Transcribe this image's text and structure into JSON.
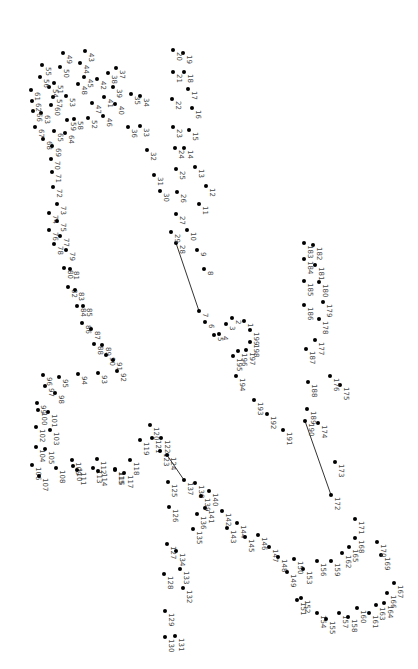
{
  "puzzle": {
    "type": "connect-the-dots",
    "dot_count": 199,
    "orientation": "rotated 90deg clockwise",
    "line_color": "#333333",
    "dot_color": "#000000",
    "label_color": "#444444",
    "drawn_segments": [
      [
        7,
        28
      ],
      [
        124,
        137
      ],
      [
        172,
        190
      ]
    ],
    "dots": [
      {
        "n": 1,
        "x": 244,
        "y": 321
      },
      {
        "n": 2,
        "x": 232,
        "y": 318
      },
      {
        "n": 3,
        "x": 226,
        "y": 324
      },
      {
        "n": 4,
        "x": 219,
        "y": 334
      },
      {
        "n": 5,
        "x": 214,
        "y": 335
      },
      {
        "n": 6,
        "x": 205,
        "y": 322
      },
      {
        "n": 7,
        "x": 199,
        "y": 311
      },
      {
        "n": 8,
        "x": 204,
        "y": 269
      },
      {
        "n": 9,
        "x": 197,
        "y": 250
      },
      {
        "n": 10,
        "x": 187,
        "y": 230
      },
      {
        "n": 11,
        "x": 199,
        "y": 204
      },
      {
        "n": 12,
        "x": 206,
        "y": 186
      },
      {
        "n": 13,
        "x": 195,
        "y": 167
      },
      {
        "n": 14,
        "x": 184,
        "y": 148
      },
      {
        "n": 15,
        "x": 189,
        "y": 130
      },
      {
        "n": 16,
        "x": 192,
        "y": 108
      },
      {
        "n": 17,
        "x": 188,
        "y": 89
      },
      {
        "n": 18,
        "x": 184,
        "y": 72
      },
      {
        "n": 19,
        "x": 183,
        "y": 53
      },
      {
        "n": 20,
        "x": 173,
        "y": 50
      },
      {
        "n": 21,
        "x": 173,
        "y": 72
      },
      {
        "n": 22,
        "x": 172,
        "y": 99
      },
      {
        "n": 23,
        "x": 173,
        "y": 127
      },
      {
        "n": 24,
        "x": 175,
        "y": 148
      },
      {
        "n": 25,
        "x": 176,
        "y": 169
      },
      {
        "n": 26,
        "x": 177,
        "y": 192
      },
      {
        "n": 27,
        "x": 176,
        "y": 214
      },
      {
        "n": 28,
        "x": 176,
        "y": 243
      },
      {
        "n": 29,
        "x": 171,
        "y": 232
      },
      {
        "n": 30,
        "x": 160,
        "y": 191
      },
      {
        "n": 31,
        "x": 154,
        "y": 175
      },
      {
        "n": 32,
        "x": 147,
        "y": 150
      },
      {
        "n": 33,
        "x": 140,
        "y": 126
      },
      {
        "n": 34,
        "x": 140,
        "y": 96
      },
      {
        "n": 35,
        "x": 131,
        "y": 94
      },
      {
        "n": 36,
        "x": 128,
        "y": 127
      },
      {
        "n": 37,
        "x": 116,
        "y": 68
      },
      {
        "n": 38,
        "x": 108,
        "y": 73
      },
      {
        "n": 39,
        "x": 113,
        "y": 87
      },
      {
        "n": 40,
        "x": 115,
        "y": 104
      },
      {
        "n": 41,
        "x": 104,
        "y": 97
      },
      {
        "n": 42,
        "x": 97,
        "y": 79
      },
      {
        "n": 43,
        "x": 85,
        "y": 51
      },
      {
        "n": 44,
        "x": 80,
        "y": 63
      },
      {
        "n": 45,
        "x": 84,
        "y": 77
      },
      {
        "n": 46,
        "x": 103,
        "y": 116
      },
      {
        "n": 47,
        "x": 92,
        "y": 103
      },
      {
        "n": 48,
        "x": 78,
        "y": 84
      },
      {
        "n": 49,
        "x": 63,
        "y": 53
      },
      {
        "n": 50,
        "x": 60,
        "y": 67
      },
      {
        "n": 51,
        "x": 54,
        "y": 83
      },
      {
        "n": 52,
        "x": 88,
        "y": 118
      },
      {
        "n": 53,
        "x": 66,
        "y": 96
      },
      {
        "n": 54,
        "x": 49,
        "y": 87
      },
      {
        "n": 55,
        "x": 42,
        "y": 65
      },
      {
        "n": 56,
        "x": 40,
        "y": 77
      },
      {
        "n": 57,
        "x": 53,
        "y": 97
      },
      {
        "n": 58,
        "x": 74,
        "y": 119
      },
      {
        "n": 59,
        "x": 67,
        "y": 120
      },
      {
        "n": 60,
        "x": 51,
        "y": 105
      },
      {
        "n": 61,
        "x": 31,
        "y": 90
      },
      {
        "n": 62,
        "x": 32,
        "y": 101
      },
      {
        "n": 63,
        "x": 41,
        "y": 113
      },
      {
        "n": 64,
        "x": 65,
        "y": 133
      },
      {
        "n": 65,
        "x": 54,
        "y": 131
      },
      {
        "n": 66,
        "x": 33,
        "y": 111
      },
      {
        "n": 67,
        "x": 35,
        "y": 127
      },
      {
        "n": 68,
        "x": 43,
        "y": 139
      },
      {
        "n": 69,
        "x": 52,
        "y": 146
      },
      {
        "n": 70,
        "x": 51,
        "y": 159
      },
      {
        "n": 71,
        "x": 52,
        "y": 172
      },
      {
        "n": 72,
        "x": 53,
        "y": 187
      },
      {
        "n": 73,
        "x": 57,
        "y": 204
      },
      {
        "n": 74,
        "x": 49,
        "y": 213
      },
      {
        "n": 75,
        "x": 57,
        "y": 221
      },
      {
        "n": 76,
        "x": 49,
        "y": 230
      },
      {
        "n": 77,
        "x": 60,
        "y": 236
      },
      {
        "n": 78,
        "x": 54,
        "y": 244
      },
      {
        "n": 79,
        "x": 66,
        "y": 250
      },
      {
        "n": 80,
        "x": 64,
        "y": 268
      },
      {
        "n": 81,
        "x": 70,
        "y": 269
      },
      {
        "n": 82,
        "x": 68,
        "y": 287
      },
      {
        "n": 83,
        "x": 75,
        "y": 290
      },
      {
        "n": 84,
        "x": 77,
        "y": 306
      },
      {
        "n": 85,
        "x": 83,
        "y": 306
      },
      {
        "n": 86,
        "x": 82,
        "y": 323
      },
      {
        "n": 87,
        "x": 91,
        "y": 329
      },
      {
        "n": 88,
        "x": 94,
        "y": 344
      },
      {
        "n": 89,
        "x": 102,
        "y": 345
      },
      {
        "n": 90,
        "x": 106,
        "y": 355
      },
      {
        "n": 91,
        "x": 113,
        "y": 360
      },
      {
        "n": 92,
        "x": 117,
        "y": 371
      },
      {
        "n": 93,
        "x": 98,
        "y": 373
      },
      {
        "n": 94,
        "x": 78,
        "y": 374
      },
      {
        "n": 95,
        "x": 59,
        "y": 377
      },
      {
        "n": 96,
        "x": 43,
        "y": 375
      },
      {
        "n": 97,
        "x": 45,
        "y": 386
      },
      {
        "n": 98,
        "x": 55,
        "y": 393
      },
      {
        "n": 99,
        "x": 37,
        "y": 403
      },
      {
        "n": 100,
        "x": 38,
        "y": 410
      },
      {
        "n": 101,
        "x": 48,
        "y": 412
      },
      {
        "n": 102,
        "x": 36,
        "y": 427
      },
      {
        "n": 103,
        "x": 50,
        "y": 430
      },
      {
        "n": 104,
        "x": 36,
        "y": 447
      },
      {
        "n": 105,
        "x": 45,
        "y": 449
      },
      {
        "n": 106,
        "x": 32,
        "y": 465
      },
      {
        "n": 107,
        "x": 39,
        "y": 476
      },
      {
        "n": 108,
        "x": 56,
        "y": 468
      },
      {
        "n": 109,
        "x": 72,
        "y": 460
      },
      {
        "n": 110,
        "x": 73,
        "y": 466
      },
      {
        "n": 111,
        "x": 77,
        "y": 470
      },
      {
        "n": 112,
        "x": 97,
        "y": 459
      },
      {
        "n": 113,
        "x": 93,
        "y": 468
      },
      {
        "n": 114,
        "x": 98,
        "y": 471
      },
      {
        "n": 115,
        "x": 115,
        "y": 469
      },
      {
        "n": 116,
        "x": 115,
        "y": 470
      },
      {
        "n": 117,
        "x": 124,
        "y": 473
      },
      {
        "n": 118,
        "x": 130,
        "y": 460
      },
      {
        "n": 119,
        "x": 140,
        "y": 440
      },
      {
        "n": 120,
        "x": 150,
        "y": 425
      },
      {
        "n": 121,
        "x": 152,
        "y": 438
      },
      {
        "n": 122,
        "x": 161,
        "y": 438
      },
      {
        "n": 123,
        "x": 160,
        "y": 451
      },
      {
        "n": 124,
        "x": 167,
        "y": 455
      },
      {
        "n": 125,
        "x": 168,
        "y": 482
      },
      {
        "n": 126,
        "x": 169,
        "y": 507
      },
      {
        "n": 127,
        "x": 167,
        "y": 544
      },
      {
        "n": 128,
        "x": 164,
        "y": 574
      },
      {
        "n": 129,
        "x": 165,
        "y": 611
      },
      {
        "n": 130,
        "x": 165,
        "y": 637
      },
      {
        "n": 131,
        "x": 175,
        "y": 636
      },
      {
        "n": 132,
        "x": 183,
        "y": 588
      },
      {
        "n": 133,
        "x": 180,
        "y": 569
      },
      {
        "n": 134,
        "x": 176,
        "y": 551
      },
      {
        "n": 135,
        "x": 193,
        "y": 529
      },
      {
        "n": 136,
        "x": 197,
        "y": 514
      },
      {
        "n": 137,
        "x": 184,
        "y": 480
      },
      {
        "n": 138,
        "x": 195,
        "y": 483
      },
      {
        "n": 139,
        "x": 201,
        "y": 496
      },
      {
        "n": 140,
        "x": 209,
        "y": 491
      },
      {
        "n": 141,
        "x": 205,
        "y": 508
      },
      {
        "n": 142,
        "x": 222,
        "y": 511
      },
      {
        "n": 143,
        "x": 227,
        "y": 528
      },
      {
        "n": 144,
        "x": 237,
        "y": 523
      },
      {
        "n": 145,
        "x": 245,
        "y": 537
      },
      {
        "n": 146,
        "x": 258,
        "y": 535
      },
      {
        "n": 147,
        "x": 269,
        "y": 547
      },
      {
        "n": 148,
        "x": 278,
        "y": 557
      },
      {
        "n": 149,
        "x": 287,
        "y": 572
      },
      {
        "n": 150,
        "x": 294,
        "y": 559
      },
      {
        "n": 151,
        "x": 297,
        "y": 600
      },
      {
        "n": 152,
        "x": 301,
        "y": 598
      },
      {
        "n": 153,
        "x": 303,
        "y": 569
      },
      {
        "n": 154,
        "x": 317,
        "y": 613
      },
      {
        "n": 155,
        "x": 326,
        "y": 619
      },
      {
        "n": 156,
        "x": 317,
        "y": 561
      },
      {
        "n": 157,
        "x": 339,
        "y": 613
      },
      {
        "n": 158,
        "x": 348,
        "y": 617
      },
      {
        "n": 159,
        "x": 331,
        "y": 561
      },
      {
        "n": 160,
        "x": 357,
        "y": 608
      },
      {
        "n": 161,
        "x": 369,
        "y": 613
      },
      {
        "n": 162,
        "x": 342,
        "y": 553
      },
      {
        "n": 163,
        "x": 376,
        "y": 605
      },
      {
        "n": 164,
        "x": 384,
        "y": 603
      },
      {
        "n": 165,
        "x": 349,
        "y": 547
      },
      {
        "n": 166,
        "x": 387,
        "y": 593
      },
      {
        "n": 167,
        "x": 394,
        "y": 583
      },
      {
        "n": 168,
        "x": 355,
        "y": 538
      },
      {
        "n": 169,
        "x": 381,
        "y": 555
      },
      {
        "n": 170,
        "x": 377,
        "y": 542
      },
      {
        "n": 171,
        "x": 355,
        "y": 519
      },
      {
        "n": 172,
        "x": 331,
        "y": 495
      },
      {
        "n": 173,
        "x": 335,
        "y": 462
      },
      {
        "n": 174,
        "x": 318,
        "y": 423
      },
      {
        "n": 175,
        "x": 340,
        "y": 385
      },
      {
        "n": 176,
        "x": 330,
        "y": 376
      },
      {
        "n": 177,
        "x": 315,
        "y": 340
      },
      {
        "n": 178,
        "x": 319,
        "y": 319
      },
      {
        "n": 179,
        "x": 323,
        "y": 302
      },
      {
        "n": 180,
        "x": 319,
        "y": 282
      },
      {
        "n": 181,
        "x": 315,
        "y": 265
      },
      {
        "n": 182,
        "x": 313,
        "y": 245
      },
      {
        "n": 183,
        "x": 304,
        "y": 243
      },
      {
        "n": 184,
        "x": 304,
        "y": 259
      },
      {
        "n": 185,
        "x": 304,
        "y": 281
      },
      {
        "n": 186,
        "x": 304,
        "y": 305
      },
      {
        "n": 187,
        "x": 306,
        "y": 349
      },
      {
        "n": 188,
        "x": 308,
        "y": 382
      },
      {
        "n": 189,
        "x": 307,
        "y": 409
      },
      {
        "n": 190,
        "x": 305,
        "y": 421
      },
      {
        "n": 191,
        "x": 283,
        "y": 430
      },
      {
        "n": 192,
        "x": 267,
        "y": 414
      },
      {
        "n": 193,
        "x": 254,
        "y": 400
      },
      {
        "n": 194,
        "x": 236,
        "y": 376
      },
      {
        "n": 195,
        "x": 233,
        "y": 356
      },
      {
        "n": 196,
        "x": 238,
        "y": 351
      },
      {
        "n": 197,
        "x": 246,
        "y": 350
      },
      {
        "n": 198,
        "x": 250,
        "y": 342
      },
      {
        "n": 199,
        "x": 250,
        "y": 330
      }
    ]
  }
}
